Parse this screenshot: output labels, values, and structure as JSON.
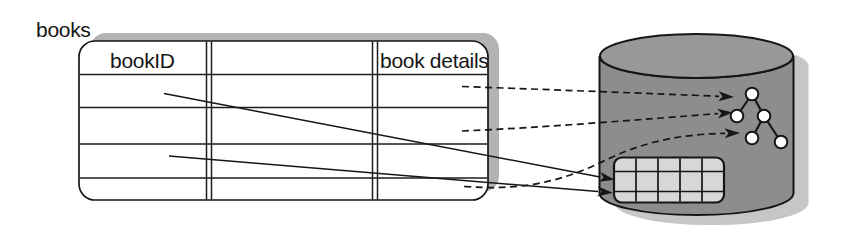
{
  "canvas": {
    "width": 841,
    "height": 234
  },
  "labels": {
    "table_title": "books",
    "column_bookid": "bookID",
    "column_book_details": "book details"
  },
  "table": {
    "title": "books",
    "columns": [
      {
        "label": "bookID"
      },
      {
        "label": ""
      },
      {
        "label": "book details"
      }
    ],
    "data_rows": 4
  },
  "database": {
    "shape": "cylinder",
    "tree": {
      "node_count": 5,
      "levels": 3
    },
    "grid": {
      "rows": 3,
      "cols": 5
    }
  },
  "arrows": {
    "solid": [
      {
        "from": "bookID cell row 1",
        "to": "grid structure"
      },
      {
        "from": "bookID cell row 3",
        "to": "grid structure"
      }
    ],
    "dashed": [
      {
        "from": "book details cell row 1",
        "to": "tree root node"
      },
      {
        "from": "book details cell row 2",
        "to": "tree left child node"
      },
      {
        "from": "book details cell row 4",
        "to": "tree lower left node"
      }
    ]
  },
  "colors": {
    "line": "#161616",
    "table_fill": "#ffffff",
    "table_shadow": "#b3b3b3",
    "cylinder_body": "#8d8d8d",
    "cylinder_top": "#989898",
    "cylinder_shadow": "#c6c6c6",
    "grid_fill": "#d7d7d7",
    "node_fill": "#ffffff"
  }
}
